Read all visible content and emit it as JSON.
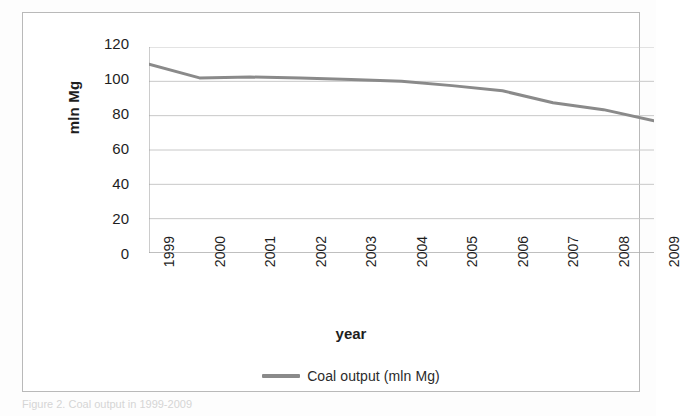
{
  "figure": {
    "caption": "Figure 2. Coal output in 1999-2009"
  },
  "axes": {
    "y_title": "mln Mg",
    "x_title": "year",
    "y_ticks": [
      "0",
      "20",
      "40",
      "60",
      "80",
      "100",
      "120"
    ]
  },
  "legend": {
    "swatch_name": "line-swatch",
    "label": "Coal output (mln Mg)",
    "color": "#8a8a8a"
  },
  "colors": {
    "series_line": "#8a8a8a",
    "gridline": "#c8c8c8",
    "axis": "#9a9a9a",
    "frame": "#b9b9b9",
    "text": "#1e1e1e"
  },
  "chart_data": {
    "type": "line",
    "title": "",
    "subtitle": "",
    "xlabel": "year",
    "ylabel": "mln Mg",
    "x": [
      1999,
      2000,
      2001,
      2002,
      2003,
      2004,
      2005,
      2006,
      2007,
      2008,
      2009
    ],
    "categories": [
      "1999",
      "2000",
      "2001",
      "2002",
      "2003",
      "2004",
      "2005",
      "2006",
      "2007",
      "2008",
      "2009"
    ],
    "series": [
      {
        "name": "Coal output (mln Mg)",
        "color": "#8a8a8a",
        "values": [
          110,
          102,
          102.5,
          102,
          101,
          100,
          97.5,
          94.5,
          87.5,
          83.5,
          77
        ]
      }
    ],
    "ylim": [
      0,
      120
    ],
    "ytick_step": 20,
    "grid": true,
    "grid_axis": "y",
    "legend_position": "bottom",
    "markers": false,
    "xtick_rotation": -90
  }
}
